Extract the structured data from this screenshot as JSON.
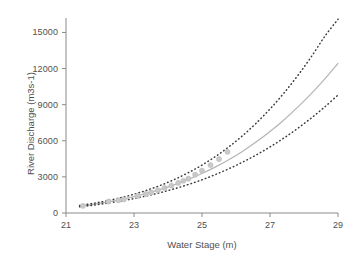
{
  "chart_data": {
    "type": "line",
    "title": "",
    "xlabel": "Water Stage (m)",
    "ylabel": "River Discharge (m3s-1)",
    "xlim": [
      21,
      29
    ],
    "ylim": [
      0,
      16200
    ],
    "xticks": [
      21,
      23,
      25,
      27,
      29
    ],
    "xtick_labels": [
      "21",
      "23",
      "25",
      "27",
      "29"
    ],
    "yticks": [
      0,
      3000,
      6000,
      9000,
      12000,
      15000
    ],
    "ytick_labels": [
      "0",
      "3000",
      "6000",
      "9000",
      "12000",
      "15000"
    ],
    "grid": false,
    "legend": "none",
    "series": [
      {
        "name": "rating-curve-fit",
        "style": "solid",
        "color": "#b4b4b4",
        "x": [
          21.4,
          21.8,
          22.2,
          22.6,
          23.0,
          23.4,
          23.8,
          24.2,
          24.6,
          25.0,
          25.4,
          25.8,
          26.2,
          26.6,
          27.0,
          27.4,
          27.8,
          28.2,
          28.6,
          29.0
        ],
        "values": [
          560,
          720,
          900,
          1110,
          1360,
          1650,
          1980,
          2360,
          2790,
          3280,
          3830,
          4450,
          5140,
          5910,
          6770,
          7710,
          8750,
          9870,
          11100,
          12430
        ]
      },
      {
        "name": "upper-confidence-bound",
        "style": "dotted",
        "color": "#3a3a3a",
        "x": [
          21.4,
          21.8,
          22.2,
          22.6,
          23.0,
          23.4,
          23.8,
          24.2,
          24.6,
          25.0,
          25.4,
          25.8,
          26.2,
          26.6,
          27.0,
          27.4,
          27.8,
          28.2,
          28.6,
          29.0
        ],
        "values": [
          620,
          800,
          1010,
          1260,
          1560,
          1910,
          2320,
          2800,
          3350,
          3980,
          4700,
          5520,
          6440,
          7480,
          8640,
          9930,
          11360,
          12920,
          14630,
          16100
        ]
      },
      {
        "name": "lower-confidence-bound",
        "style": "dotted",
        "color": "#3a3a3a",
        "x": [
          21.4,
          21.8,
          22.2,
          22.6,
          23.0,
          23.4,
          23.8,
          24.2,
          24.6,
          25.0,
          25.4,
          25.8,
          26.2,
          26.6,
          27.0,
          27.4,
          27.8,
          28.2,
          28.6,
          29.0
        ],
        "values": [
          510,
          650,
          810,
          990,
          1200,
          1440,
          1710,
          2020,
          2370,
          2760,
          3200,
          3690,
          4230,
          4830,
          5490,
          6210,
          7000,
          7860,
          8790,
          9800
        ]
      },
      {
        "name": "observed-gaugings",
        "style": "markers",
        "color": "#c8c8c8",
        "x": [
          21.5,
          22.25,
          22.55,
          22.7,
          23.1,
          23.35,
          23.5,
          23.7,
          23.9,
          24.1,
          24.3,
          24.45,
          24.6,
          24.8,
          25.0,
          25.25,
          25.5,
          25.75
        ],
        "values": [
          600,
          950,
          1060,
          1130,
          1420,
          1580,
          1710,
          1890,
          2080,
          2280,
          2500,
          2680,
          2850,
          3180,
          3520,
          3980,
          4480,
          5080
        ]
      }
    ]
  },
  "axes": {
    "x_title": "Water Stage (m)",
    "y_title": "River Discharge (m3s-1)"
  },
  "colors": {
    "fit_line": "#b4b4b4",
    "bound_line": "#3a3a3a",
    "marker": "#c8c8c8",
    "axis": "#8a8a8a",
    "text": "#4f4f4f",
    "background": "#ffffff"
  }
}
